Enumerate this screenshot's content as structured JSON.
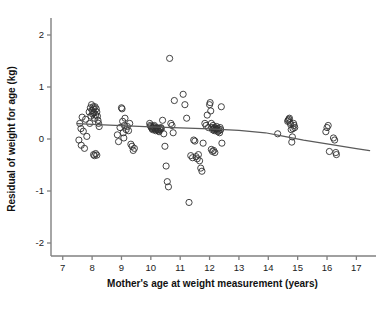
{
  "figure": {
    "background": "#ffffff",
    "axis_color": "#808080",
    "point_color": "#303030",
    "line_color": "#5a5a5a"
  },
  "chart_data": {
    "type": "scatter",
    "title": "",
    "xlabel": "Mother's age at weight measurement (years)",
    "ylabel": "Residual of weight for age (kg)",
    "xlim": [
      6.6,
      17.6
    ],
    "ylim": [
      -2.25,
      2.25
    ],
    "xticks": [
      7,
      8,
      9,
      10,
      11,
      12,
      13,
      14,
      15,
      16,
      17
    ],
    "yticks": [
      2,
      1,
      0,
      -1,
      -2
    ],
    "xticklabels": [
      "7",
      "8",
      "9",
      "10",
      "11",
      "12",
      "13",
      "14",
      "15",
      "16",
      "17"
    ],
    "yticklabels": [
      "2",
      "1",
      "0",
      "-1",
      "-2"
    ],
    "grid": false,
    "legend": null,
    "marker": "open-circle",
    "marker_size": 3.1,
    "series": [
      {
        "name": "Residual of weight for age",
        "x": [
          7.55,
          7.58,
          7.62,
          7.63,
          7.66,
          7.7,
          7.74,
          7.78,
          7.82,
          7.9,
          7.92,
          7.94,
          7.96,
          7.98,
          8.0,
          8.02,
          8.04,
          8.05,
          8.06,
          8.08,
          8.1,
          8.12,
          8.14,
          8.16,
          8.18,
          8.2,
          8.22,
          8.24,
          8.05,
          8.08,
          8.12,
          8.16,
          8.86,
          8.9,
          8.95,
          9.0,
          9.02,
          9.04,
          9.06,
          9.08,
          9.1,
          9.12,
          9.16,
          9.2,
          9.24,
          9.28,
          9.32,
          9.36,
          9.4,
          9.44,
          9.96,
          9.98,
          10.0,
          10.02,
          10.04,
          10.06,
          10.08,
          10.1,
          10.12,
          10.14,
          10.16,
          10.18,
          10.2,
          10.22,
          10.24,
          10.26,
          10.28,
          10.3,
          10.32,
          10.34,
          10.36,
          10.4,
          10.44,
          10.48,
          10.52,
          10.56,
          10.6,
          10.64,
          10.68,
          10.72,
          10.76,
          10.8,
          11.1,
          11.16,
          11.22,
          11.3,
          11.36,
          11.42,
          11.46,
          11.5,
          11.54,
          11.58,
          11.62,
          11.66,
          11.7,
          11.74,
          11.78,
          11.84,
          11.88,
          11.92,
          11.96,
          12.0,
          12.02,
          12.04,
          12.06,
          12.08,
          12.1,
          12.12,
          12.14,
          12.16,
          12.18,
          12.2,
          12.22,
          12.24,
          12.26,
          12.28,
          12.3,
          12.32,
          12.34,
          12.36,
          12.38,
          12.4,
          12.42,
          12.06,
          12.1,
          12.14,
          12.18,
          14.32,
          14.66,
          14.68,
          14.7,
          14.72,
          14.74,
          14.76,
          14.78,
          14.8,
          14.82,
          14.84,
          14.86,
          14.88,
          14.9,
          15.96,
          16.0,
          16.04,
          16.08,
          16.22,
          16.26,
          16.3,
          16.32
        ],
        "y": [
          -0.02,
          0.3,
          0.2,
          -0.12,
          0.42,
          0.15,
          -0.18,
          0.38,
          0.05,
          0.52,
          0.3,
          0.6,
          0.44,
          0.66,
          0.55,
          0.48,
          0.62,
          0.58,
          0.5,
          0.4,
          0.62,
          0.46,
          0.58,
          0.52,
          0.44,
          0.36,
          0.3,
          0.24,
          -0.3,
          -0.32,
          -0.28,
          -0.31,
          0.08,
          -0.05,
          0.22,
          0.6,
          0.58,
          0.34,
          0.12,
          0.02,
          0.26,
          0.4,
          0.18,
          0.24,
          0.16,
          0.3,
          -0.1,
          -0.14,
          -0.22,
          -0.18,
          0.3,
          0.26,
          0.24,
          0.22,
          0.2,
          0.18,
          0.22,
          0.24,
          0.26,
          0.2,
          0.16,
          0.18,
          0.22,
          0.2,
          0.18,
          0.16,
          0.14,
          0.2,
          0.18,
          0.22,
          0.2,
          0.36,
          0.1,
          -0.14,
          -0.52,
          -0.82,
          -0.92,
          1.55,
          0.3,
          0.26,
          0.12,
          0.74,
          0.86,
          0.66,
          0.4,
          -1.22,
          -0.32,
          -0.36,
          -0.02,
          -0.04,
          -0.34,
          -0.38,
          -0.3,
          -0.42,
          -0.56,
          -0.62,
          -0.08,
          0.3,
          0.26,
          0.46,
          0.22,
          0.66,
          0.7,
          0.54,
          0.3,
          0.22,
          0.18,
          0.26,
          0.2,
          0.16,
          0.22,
          0.18,
          0.2,
          0.24,
          0.18,
          0.14,
          0.2,
          0.16,
          0.12,
          0.22,
          0.18,
          0.62,
          -0.08,
          -0.2,
          -0.24,
          -0.22,
          -0.26,
          0.1,
          0.34,
          0.36,
          0.38,
          0.4,
          0.32,
          0.28,
          0.18,
          -0.06,
          0.04,
          0.2,
          0.3,
          0.26,
          0.22,
          0.14,
          0.22,
          0.26,
          -0.24,
          0.02,
          -0.02,
          -0.26,
          -0.3
        ]
      }
    ],
    "trend_line": {
      "name": "smoothed trend",
      "x": [
        7.5,
        8.2,
        9.0,
        10.0,
        11.0,
        12.0,
        13.0,
        13.9,
        14.5,
        15.2,
        16.0,
        17.0,
        17.45
      ],
      "y": [
        0.295,
        0.275,
        0.255,
        0.235,
        0.215,
        0.195,
        0.165,
        0.12,
        0.055,
        -0.02,
        -0.095,
        -0.185,
        -0.225
      ]
    }
  },
  "caption": ""
}
